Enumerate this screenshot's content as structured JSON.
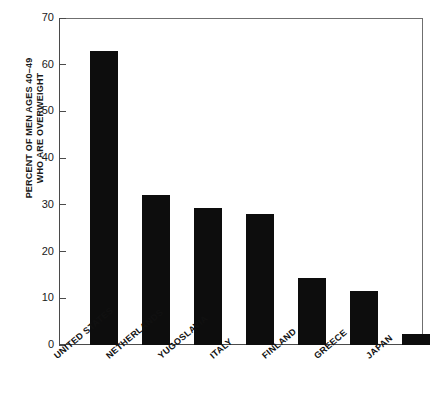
{
  "chart_data": {
    "type": "bar",
    "title": "",
    "subtitle": "",
    "xlabel": "",
    "ylabel": "PERCENT OF MEN AGES 40–49 WHO ARE OVERWEIGHT",
    "ylabel_lines": [
      "PERCENT OF MEN AGES 40–49",
      "WHO ARE OVERWEIGHT"
    ],
    "categories": [
      "UNITED STATES",
      "NETHERLANDS",
      "YUGOSLAVIA",
      "ITALY",
      "FINLAND",
      "GREECE",
      "JAPAN"
    ],
    "values": [
      63,
      32.2,
      29.4,
      28.1,
      14.4,
      11.5,
      2.3
    ],
    "ylim": [
      0,
      70
    ],
    "ytick_labels": [
      "0",
      "10",
      "20",
      "30",
      "40",
      "50",
      "60",
      "70"
    ],
    "ytick_values": [
      0,
      10,
      20,
      30,
      40,
      50,
      60,
      70
    ],
    "grid": false,
    "legend": null,
    "bar_color": "#0d0d0d",
    "axis_color": "#4a4a4a",
    "background_color": "#ffffff"
  }
}
